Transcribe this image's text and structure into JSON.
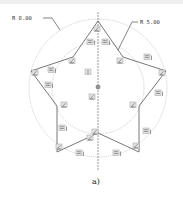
{
  "diagram": {
    "type": "cad-sketch",
    "dimensions": [
      {
        "id": "outer",
        "label": "R 8.00",
        "target": "outer-construction-circle"
      },
      {
        "id": "inner",
        "label": "R 5.00",
        "target": "inner-construction-circle"
      }
    ],
    "caption": "a)",
    "colors": {
      "outline": "#555555",
      "construction": "#b5b5b5",
      "centerline": "#555555",
      "badge_fill": "#e4e4e4"
    },
    "constraints": {
      "equal_length_count": 10,
      "coincident_count": 11,
      "other_symbols": [
        "vertical-axis-constraint",
        "center-point"
      ]
    }
  }
}
